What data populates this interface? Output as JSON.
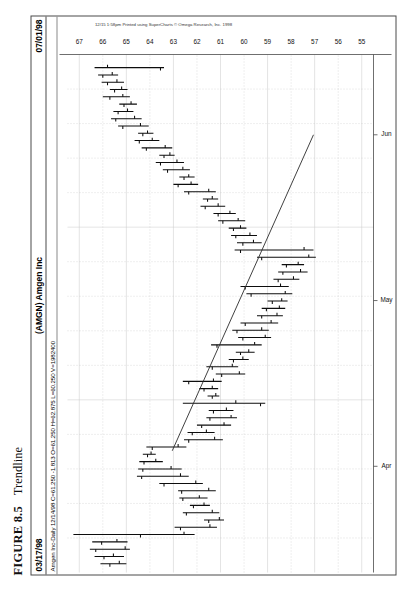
{
  "figure": {
    "number": "FIGURE 8.5",
    "title": "Trendline"
  },
  "chart_header": {
    "start_date": "03/17/98",
    "symbol_name": "(AMGN) Amgen Inc",
    "end_date": "07/01/98"
  },
  "quote_line": "Amgen Inc-Daily 12/14/98 C=61.250 -1.813 O=61.250 H=62.875 L=60.250 V=1982400",
  "copyright": "12/15 1:58pm Printed using SuperCharts © Omega Research, Inc. 1998",
  "chart_data": {
    "type": "ohlc",
    "title": "(AMGN) Amgen Inc",
    "subtitle": "Amgen Inc-Daily",
    "xlabel": "",
    "ylabel": "",
    "grid": true,
    "legend": "none",
    "ylim": [
      54.5,
      67.5
    ],
    "y_ticks": [
      67,
      66,
      65,
      64,
      63,
      62,
      61,
      60,
      59,
      58,
      57,
      56,
      55
    ],
    "x_ticks": [
      "Apr",
      "May",
      "Jun"
    ],
    "x_tick_positions": [
      0.205,
      0.525,
      0.845
    ],
    "date_range": [
      "03/17/98",
      "07/01/98"
    ],
    "quote": {
      "last": 61.25,
      "change": -1.813,
      "open": 61.25,
      "high": 62.875,
      "low": 60.25,
      "volume": 1982400,
      "quote_date": "12/14/98"
    },
    "annotations": [
      {
        "type": "trendline",
        "label": "Trendline",
        "x1": 0.235,
        "y1": 63.05,
        "x2": 0.845,
        "y2": 57.05
      }
    ],
    "bars": [
      {
        "i": 0,
        "open": 65.7,
        "high": 66.1,
        "low": 65.0,
        "close": 65.3
      },
      {
        "i": 1,
        "open": 65.95,
        "high": 66.35,
        "low": 65.1,
        "close": 65.55
      },
      {
        "i": 2,
        "open": 66.3,
        "high": 66.55,
        "low": 64.85,
        "close": 65.05
      },
      {
        "i": 3,
        "open": 66.05,
        "high": 66.45,
        "low": 64.95,
        "close": 65.4
      },
      {
        "i": 4,
        "open": 64.4,
        "high": 67.25,
        "low": 62.1,
        "close": 62.55
      },
      {
        "i": 5,
        "open": 62.7,
        "high": 62.95,
        "low": 61.15,
        "close": 61.45
      },
      {
        "i": 6,
        "open": 61.5,
        "high": 61.7,
        "low": 60.85,
        "close": 61.05
      },
      {
        "i": 7,
        "open": 62.45,
        "high": 62.6,
        "low": 61.05,
        "close": 61.35
      },
      {
        "i": 8,
        "open": 62.15,
        "high": 62.3,
        "low": 61.45,
        "close": 61.7
      },
      {
        "i": 9,
        "open": 62.6,
        "high": 62.75,
        "low": 61.55,
        "close": 61.9
      },
      {
        "i": 10,
        "open": 62.65,
        "high": 62.8,
        "low": 61.2,
        "close": 61.5
      },
      {
        "i": 11,
        "open": 63.4,
        "high": 63.6,
        "low": 61.75,
        "close": 62.05
      },
      {
        "i": 12,
        "open": 64.35,
        "high": 64.55,
        "low": 62.35,
        "close": 62.7
      },
      {
        "i": 13,
        "open": 64.3,
        "high": 64.5,
        "low": 62.65,
        "close": 63.1
      },
      {
        "i": 14,
        "open": 64.25,
        "high": 64.45,
        "low": 63.45,
        "close": 63.75
      },
      {
        "i": 15,
        "open": 64.1,
        "high": 64.3,
        "low": 63.75,
        "close": 63.95
      },
      {
        "i": 16,
        "open": 63.9,
        "high": 64.15,
        "low": 62.45,
        "close": 62.8
      },
      {
        "i": 17,
        "open": 62.35,
        "high": 62.55,
        "low": 60.9,
        "close": 61.25
      },
      {
        "i": 18,
        "open": 62.2,
        "high": 62.4,
        "low": 61.25,
        "close": 61.6
      },
      {
        "i": 19,
        "open": 61.8,
        "high": 62.0,
        "low": 60.55,
        "close": 60.85
      },
      {
        "i": 20,
        "open": 61.45,
        "high": 61.6,
        "low": 60.3,
        "close": 60.55
      },
      {
        "i": 21,
        "open": 61.3,
        "high": 61.5,
        "low": 60.45,
        "close": 60.75
      },
      {
        "i": 22,
        "open": 59.3,
        "high": 62.6,
        "low": 59.1,
        "close": 60.35
      },
      {
        "i": 23,
        "open": 61.35,
        "high": 61.55,
        "low": 61.05,
        "close": 61.2
      },
      {
        "i": 24,
        "open": 61.7,
        "high": 61.9,
        "low": 61.1,
        "close": 61.35
      },
      {
        "i": 25,
        "open": 62.35,
        "high": 62.6,
        "low": 60.95,
        "close": 61.3
      },
      {
        "i": 26,
        "open": 60.95,
        "high": 61.2,
        "low": 59.95,
        "close": 60.2
      },
      {
        "i": 27,
        "open": 61.35,
        "high": 61.6,
        "low": 60.25,
        "close": 60.5
      },
      {
        "i": 28,
        "open": 60.45,
        "high": 60.65,
        "low": 59.8,
        "close": 60.05
      },
      {
        "i": 29,
        "open": 60.15,
        "high": 60.35,
        "low": 59.55,
        "close": 59.8
      },
      {
        "i": 30,
        "open": 61.15,
        "high": 61.4,
        "low": 59.25,
        "close": 59.55
      },
      {
        "i": 31,
        "open": 60.05,
        "high": 60.25,
        "low": 58.85,
        "close": 59.1
      },
      {
        "i": 32,
        "open": 60.3,
        "high": 60.5,
        "low": 58.95,
        "close": 59.25
      },
      {
        "i": 33,
        "open": 59.95,
        "high": 60.15,
        "low": 58.55,
        "close": 58.85
      },
      {
        "i": 34,
        "open": 59.25,
        "high": 59.45,
        "low": 58.35,
        "close": 58.6
      },
      {
        "i": 35,
        "open": 59.05,
        "high": 59.25,
        "low": 58.25,
        "close": 58.5
      },
      {
        "i": 36,
        "open": 58.8,
        "high": 59.0,
        "low": 58.15,
        "close": 58.4
      },
      {
        "i": 37,
        "open": 59.7,
        "high": 59.9,
        "low": 57.95,
        "close": 58.25
      },
      {
        "i": 38,
        "open": 59.95,
        "high": 60.15,
        "low": 58.1,
        "close": 58.45
      },
      {
        "i": 39,
        "open": 58.55,
        "high": 58.75,
        "low": 57.65,
        "close": 57.9
      },
      {
        "i": 40,
        "open": 58.35,
        "high": 58.55,
        "low": 57.3,
        "close": 57.6
      },
      {
        "i": 41,
        "open": 58.2,
        "high": 58.4,
        "low": 57.45,
        "close": 57.7
      },
      {
        "i": 42,
        "open": 59.25,
        "high": 59.45,
        "low": 56.95,
        "close": 57.25
      },
      {
        "i": 43,
        "open": 60.15,
        "high": 60.4,
        "low": 57.05,
        "close": 57.45
      },
      {
        "i": 44,
        "open": 60.05,
        "high": 60.3,
        "low": 59.25,
        "close": 59.6
      },
      {
        "i": 45,
        "open": 60.35,
        "high": 60.55,
        "low": 59.45,
        "close": 59.75
      },
      {
        "i": 46,
        "open": 60.45,
        "high": 60.65,
        "low": 59.9,
        "close": 60.15
      },
      {
        "i": 47,
        "open": 60.9,
        "high": 61.1,
        "low": 59.95,
        "close": 60.25
      },
      {
        "i": 48,
        "open": 61.1,
        "high": 61.3,
        "low": 60.35,
        "close": 60.6
      },
      {
        "i": 49,
        "open": 61.65,
        "high": 61.85,
        "low": 60.8,
        "close": 61.1
      },
      {
        "i": 50,
        "open": 61.55,
        "high": 61.75,
        "low": 61.1,
        "close": 61.35
      },
      {
        "i": 51,
        "open": 62.35,
        "high": 62.55,
        "low": 61.2,
        "close": 61.5
      },
      {
        "i": 52,
        "open": 62.8,
        "high": 63.0,
        "low": 61.95,
        "close": 62.25
      },
      {
        "i": 53,
        "open": 62.55,
        "high": 62.75,
        "low": 62.1,
        "close": 62.35
      },
      {
        "i": 54,
        "open": 63.25,
        "high": 63.45,
        "low": 62.3,
        "close": 62.6
      },
      {
        "i": 55,
        "open": 63.55,
        "high": 63.75,
        "low": 62.55,
        "close": 62.85
      },
      {
        "i": 56,
        "open": 63.4,
        "high": 63.6,
        "low": 62.95,
        "close": 63.15
      },
      {
        "i": 57,
        "open": 64.15,
        "high": 64.35,
        "low": 63.05,
        "close": 63.35
      },
      {
        "i": 58,
        "open": 64.45,
        "high": 64.65,
        "low": 63.6,
        "close": 63.9
      },
      {
        "i": 59,
        "open": 64.3,
        "high": 64.5,
        "low": 63.85,
        "close": 64.1
      },
      {
        "i": 60,
        "open": 65.15,
        "high": 65.35,
        "low": 64.05,
        "close": 64.4
      },
      {
        "i": 61,
        "open": 65.45,
        "high": 65.65,
        "low": 64.35,
        "close": 64.65
      },
      {
        "i": 62,
        "open": 65.35,
        "high": 65.55,
        "low": 64.7,
        "close": 64.95
      },
      {
        "i": 63,
        "open": 65.1,
        "high": 65.3,
        "low": 64.55,
        "close": 64.8
      },
      {
        "i": 64,
        "open": 65.7,
        "high": 66.0,
        "low": 64.85,
        "close": 65.15
      },
      {
        "i": 65,
        "open": 65.5,
        "high": 65.7,
        "low": 64.95,
        "close": 65.2
      },
      {
        "i": 66,
        "open": 65.8,
        "high": 66.05,
        "low": 65.1,
        "close": 65.4
      },
      {
        "i": 67,
        "open": 66.0,
        "high": 66.2,
        "low": 65.35,
        "close": 65.6
      },
      {
        "i": 68,
        "open": 63.55,
        "high": 66.35,
        "low": 63.4,
        "close": 65.8
      }
    ]
  }
}
